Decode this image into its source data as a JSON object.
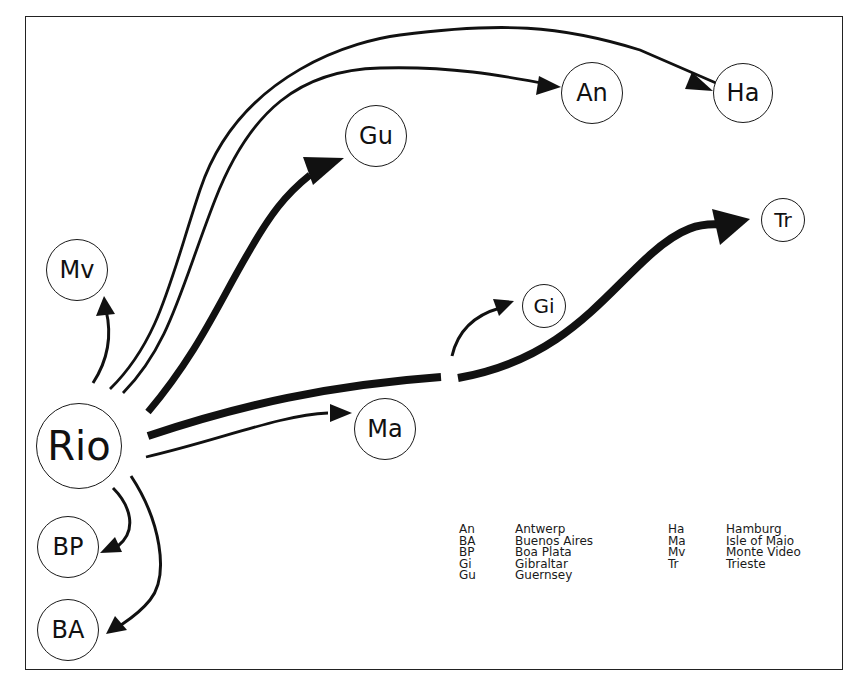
{
  "diagram": {
    "type": "flow-map",
    "origin": "Rio",
    "nodes": [
      {
        "id": "Rio",
        "label": "Rio",
        "cx": 79,
        "cy": 446,
        "r": 43,
        "font": 40
      },
      {
        "id": "Mv",
        "label": "Mv",
        "cx": 77,
        "cy": 270,
        "r": 31,
        "font": 24
      },
      {
        "id": "BP",
        "label": "BP",
        "cx": 68,
        "cy": 547,
        "r": 31,
        "font": 24
      },
      {
        "id": "BA",
        "label": "BA",
        "cx": 68,
        "cy": 630,
        "r": 31,
        "font": 24
      },
      {
        "id": "Gu",
        "label": "Gu",
        "cx": 376,
        "cy": 136,
        "r": 31,
        "font": 24
      },
      {
        "id": "An",
        "label": "An",
        "cx": 592,
        "cy": 93,
        "r": 31,
        "font": 24
      },
      {
        "id": "Ha",
        "label": "Ha",
        "cx": 743,
        "cy": 93,
        "r": 30,
        "font": 24
      },
      {
        "id": "Tr",
        "label": "Tr",
        "cx": 783,
        "cy": 220,
        "r": 22,
        "font": 20
      },
      {
        "id": "Gi",
        "label": "Gi",
        "cx": 544,
        "cy": 306,
        "r": 22,
        "font": 20
      },
      {
        "id": "Ma",
        "label": "Ma",
        "cx": 385,
        "cy": 429,
        "r": 31,
        "font": 24
      }
    ],
    "edges": [
      {
        "from": "Rio",
        "to": "Mv",
        "weight": "thin"
      },
      {
        "from": "Rio",
        "to": "Ha",
        "weight": "thin"
      },
      {
        "from": "Rio",
        "to": "An",
        "weight": "thin"
      },
      {
        "from": "Rio",
        "to": "Gu",
        "weight": "thick"
      },
      {
        "from": "Rio",
        "to": "Tr",
        "weight": "thick",
        "branch": {
          "to": "Gi",
          "weight": "thin"
        }
      },
      {
        "from": "Rio",
        "to": "Ma",
        "weight": "thin"
      },
      {
        "from": "Rio",
        "to": "BP",
        "weight": "thin"
      },
      {
        "from": "Rio",
        "to": "BA",
        "weight": "thin"
      }
    ]
  },
  "legend": {
    "left": [
      {
        "abbr": "An",
        "name": "Antwerp"
      },
      {
        "abbr": "BA",
        "name": "Buenos Aires"
      },
      {
        "abbr": "BP",
        "name": "Boa Plata"
      },
      {
        "abbr": "Gi",
        "name": "Gibraltar"
      },
      {
        "abbr": "Gu",
        "name": "Guernsey"
      }
    ],
    "right": [
      {
        "abbr": "Ha",
        "name": "Hamburg"
      },
      {
        "abbr": "Ma",
        "name": "Isle of Maio"
      },
      {
        "abbr": "Mv",
        "name": "Monte Video"
      },
      {
        "abbr": "Tr",
        "name": "Trieste"
      }
    ]
  },
  "colors": {
    "line": "#111111",
    "background": "#ffffff",
    "border": "#222222"
  }
}
